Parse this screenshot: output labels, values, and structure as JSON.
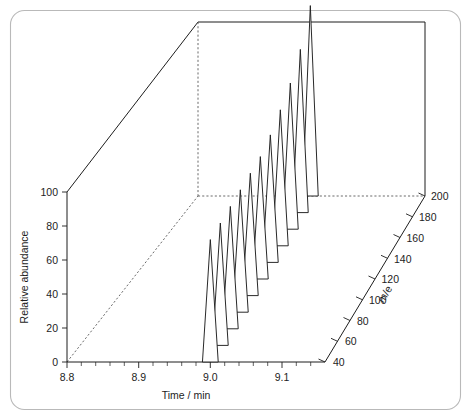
{
  "figure": {
    "border_color": "#b9b9b9",
    "background": "#ffffff",
    "line_color": "#1d1d1d"
  },
  "chart_data": {
    "type": "line",
    "title": "",
    "subtitle": "",
    "projection": "3d",
    "xlabel": "Time / min",
    "ylabel": "Relative abundance",
    "zlabel": "m/e",
    "xlim": [
      8.8,
      9.16
    ],
    "ylim": [
      0,
      100
    ],
    "zlim": [
      40,
      200
    ],
    "grid": false,
    "legend": null,
    "x_ticks": [
      8.8,
      8.9,
      9.0,
      9.1
    ],
    "x_tick_labels": [
      "8.8",
      "8.9",
      "9.0",
      "9.1"
    ],
    "x_minor_tick_step": 0.02,
    "y_ticks": [
      0,
      20,
      40,
      60,
      80,
      100
    ],
    "y_tick_labels": [
      "0",
      "20",
      "40",
      "60",
      "80",
      "100"
    ],
    "z_ticks": [
      40,
      60,
      80,
      100,
      120,
      140,
      160,
      180,
      200
    ],
    "z_tick_labels": [
      "40",
      "60",
      "80",
      "100",
      "120",
      "140",
      "160",
      "180",
      "200"
    ],
    "series": [
      {
        "name": "m/e 40",
        "me": 40,
        "peak_time": 9.0,
        "peak_height": 72,
        "half_width_min": 0.011
      },
      {
        "name": "m/e 56",
        "me": 56,
        "peak_time": 9.0,
        "peak_height": 72,
        "half_width_min": 0.011
      },
      {
        "name": "m/e 72",
        "me": 72,
        "peak_time": 9.0,
        "peak_height": 72,
        "half_width_min": 0.011
      },
      {
        "name": "m/e 88",
        "me": 88,
        "peak_time": 9.0,
        "peak_height": 72,
        "half_width_min": 0.011
      },
      {
        "name": "m/e 104",
        "me": 104,
        "peak_time": 9.0,
        "peak_height": 72,
        "half_width_min": 0.011
      },
      {
        "name": "m/e 120",
        "me": 120,
        "peak_time": 9.0,
        "peak_height": 72,
        "half_width_min": 0.011
      },
      {
        "name": "m/e 136",
        "me": 136,
        "peak_time": 9.0,
        "peak_height": 75,
        "half_width_min": 0.011
      },
      {
        "name": "m/e 152",
        "me": 152,
        "peak_time": 9.0,
        "peak_height": 80,
        "half_width_min": 0.011
      },
      {
        "name": "m/e 168",
        "me": 168,
        "peak_time": 9.0,
        "peak_height": 86,
        "half_width_min": 0.011
      },
      {
        "name": "m/e 184",
        "me": 184,
        "peak_time": 9.0,
        "peak_height": 96,
        "half_width_min": 0.011
      },
      {
        "name": "m/e 200",
        "me": 200,
        "peak_time": 9.0,
        "peak_height": 112,
        "half_width_min": 0.011
      }
    ]
  },
  "axes": {
    "x_title": "Time / min",
    "y_title": "Relative abundance",
    "z_title": "m/e"
  }
}
